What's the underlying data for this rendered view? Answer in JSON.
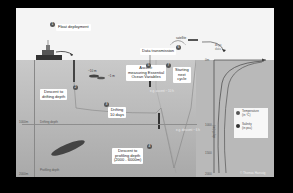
{
  "diagram": {
    "steps": [
      {
        "num": "1",
        "label": "Float deployment"
      },
      {
        "num": "2",
        "label": "Descent to\ndrifting depth"
      },
      {
        "num": "3",
        "label": "Drifting\n10 days"
      },
      {
        "num": "4",
        "label": "Descent to\nprofiling depth\n(2000 - 6000m)"
      },
      {
        "num": "5",
        "label": "Ascent:\nmeasuring Essential\nOcean Variables"
      },
      {
        "num": "6",
        "label": "Data transmission"
      },
      {
        "num": "7",
        "label": "Starting\nnext\ncycle"
      }
    ],
    "depths": {
      "drifting": "Drifting depth",
      "profiling": "Profiling depth",
      "drift_value": "1000m",
      "profile_value": "2000m"
    },
    "inline_labels": {
      "surface_ascent": "e.g. ascent ~ 10 h",
      "descent_time": "e.g. descent ~ 6 h",
      "fish1": "~10 m",
      "fish2": "~1 m"
    },
    "chart_axis": {
      "ticks": [
        "0m",
        "1000",
        "1500",
        "2000"
      ],
      "axis_label": "depth (m)"
    },
    "legend": [
      {
        "label": "Temperature\n(in °C)",
        "color": "#555555"
      },
      {
        "label": "Salinity\n(in psu)",
        "color": "#333333"
      }
    ],
    "satellite_label": "satellite",
    "argo_data_label": "Argo\ndata",
    "credit": "© Thomas Haessig",
    "colors": {
      "frame_bg": "#000000",
      "sky": "#f4f4f4",
      "sea_top": "#c9c9c9",
      "sea_bottom": "#a9a9a9",
      "badge": "#555555",
      "label_bg": "#ffffff"
    }
  }
}
